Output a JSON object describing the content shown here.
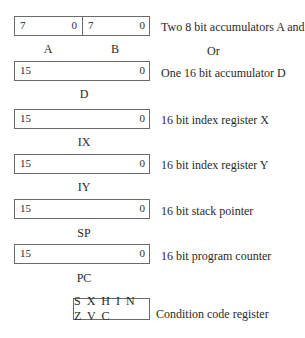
{
  "accumulators_ab": {
    "a_high_bit": "7",
    "a_low_bit": "0",
    "b_high_bit": "7",
    "b_low_bit": "0",
    "a_label": "A",
    "b_label": "B",
    "description": "Two 8 bit accumulators A and B"
  },
  "or_label": "Or",
  "accumulator_d": {
    "high_bit": "15",
    "low_bit": "0",
    "label": "D",
    "description": "One 16 bit accumulator D"
  },
  "index_x": {
    "high_bit": "15",
    "low_bit": "0",
    "label": "IX",
    "description": "16 bit index register X"
  },
  "index_y": {
    "high_bit": "15",
    "low_bit": "0",
    "label": "IY",
    "description": "16 bit index register Y"
  },
  "stack_pointer": {
    "high_bit": "15",
    "low_bit": "0",
    "label": "SP",
    "description": "16 bit stack pointer"
  },
  "program_counter": {
    "high_bit": "15",
    "low_bit": "0",
    "label": "PC",
    "description": "16 bit program counter"
  },
  "condition_code": {
    "bits": "S X H I N Z V C",
    "description": "Condition code register"
  }
}
